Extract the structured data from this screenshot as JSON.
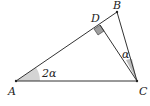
{
  "diagram": {
    "type": "geometry-triangle",
    "points": {
      "A": {
        "label": "A",
        "x": 16,
        "y": 81
      },
      "B": {
        "label": "B",
        "x": 117,
        "y": 12
      },
      "C": {
        "label": "C",
        "x": 137,
        "y": 81
      },
      "D": {
        "label": "D",
        "x": 100,
        "y": 25
      }
    },
    "segments": [
      "AB",
      "BC",
      "CA",
      "CD"
    ],
    "angles": {
      "A": {
        "label": "2α"
      },
      "C": {
        "label": "α"
      },
      "D": {
        "label": "right-angle"
      }
    },
    "colors": {
      "line": "#333333",
      "fill": "#cccccc"
    }
  }
}
